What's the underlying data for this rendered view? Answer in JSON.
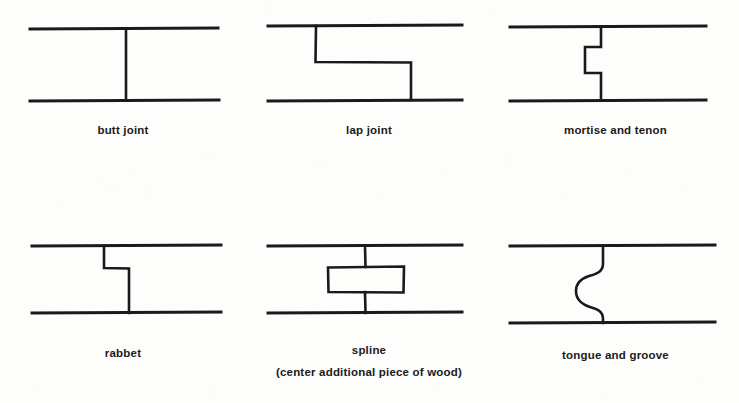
{
  "page": {
    "background_color": "#fdfdfc",
    "ink_color": "#1a1a1a",
    "width": 739,
    "height": 403
  },
  "figures": [
    {
      "id": "butt-joint",
      "label": "butt joint",
      "sublabel": "",
      "description": "Two boards meeting flush with a straight vertical seam",
      "seam_type": "straight"
    },
    {
      "id": "lap-joint",
      "label": "lap joint",
      "sublabel": "",
      "description": "Two boards overlapping with a stepped half-lap seam",
      "seam_type": "step"
    },
    {
      "id": "mortise-and-tenon",
      "label": "mortise and tenon",
      "sublabel": "",
      "description": "A tenon tongue projecting into a mortise pocket",
      "seam_type": "rectangular-tenon"
    },
    {
      "id": "rabbet",
      "label": "rabbet",
      "sublabel": "",
      "description": "A shouldered recess cut along the board edge",
      "seam_type": "shoulder"
    },
    {
      "id": "spline",
      "label": "spline",
      "sublabel": "(center additional piece of wood)",
      "description": "Two boards joined by a separate center strip of wood",
      "seam_type": "spline-strip"
    },
    {
      "id": "tongue-and-groove",
      "label": "tongue and groove",
      "sublabel": "",
      "description": "A rounded tongue fitting into a matching rounded groove",
      "seam_type": "rounded"
    }
  ]
}
